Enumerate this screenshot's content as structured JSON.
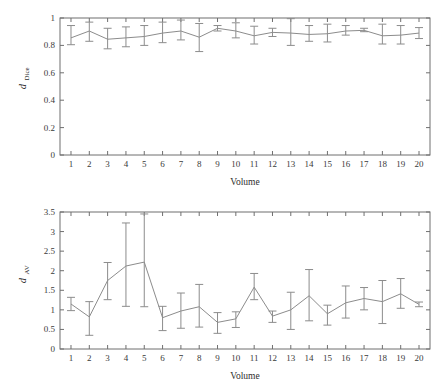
{
  "figure": {
    "background": "#ffffff",
    "line_color": "#8c8c8c",
    "axis_color": "#6f6f6f",
    "text_color": "#2e2e2e"
  },
  "chart_data": [
    {
      "type": "line",
      "panel": "top",
      "title": "",
      "xlabel": "Volume",
      "ylabel": "d_Dice",
      "ylabel_base": "d",
      "ylabel_sub": "Dice",
      "xlim": [
        0.4,
        20.6
      ],
      "ylim": [
        0,
        1
      ],
      "grid": false,
      "legend": null,
      "error_bars": true,
      "xtick_labels": [
        "1",
        "2",
        "3",
        "4",
        "5",
        "6",
        "7",
        "8",
        "9",
        "10",
        "11",
        "12",
        "13",
        "14",
        "15",
        "16",
        "17",
        "18",
        "19",
        "20"
      ],
      "ytick_labels": [
        "0",
        "0.2",
        "0.4",
        "0.6",
        "0.8",
        "1"
      ],
      "yticks": [
        0,
        0.2,
        0.4,
        0.6,
        0.8,
        1
      ],
      "x": [
        1,
        2,
        3,
        4,
        5,
        6,
        7,
        8,
        9,
        10,
        11,
        12,
        13,
        14,
        15,
        16,
        17,
        18,
        19,
        20
      ],
      "values": [
        0.855,
        0.905,
        0.845,
        0.855,
        0.865,
        0.89,
        0.905,
        0.86,
        0.925,
        0.905,
        0.87,
        0.895,
        0.89,
        0.88,
        0.885,
        0.905,
        0.91,
        0.87,
        0.875,
        0.89
      ],
      "err_low": [
        0.805,
        0.83,
        0.775,
        0.79,
        0.8,
        0.82,
        0.84,
        0.755,
        0.905,
        0.855,
        0.81,
        0.865,
        0.8,
        0.83,
        0.825,
        0.875,
        0.9,
        0.81,
        0.81,
        0.85
      ],
      "err_high": [
        0.945,
        0.97,
        0.925,
        0.935,
        0.945,
        0.97,
        0.985,
        0.96,
        0.945,
        0.965,
        0.94,
        0.925,
        0.995,
        0.945,
        0.955,
        0.945,
        0.925,
        0.955,
        0.945,
        0.93
      ]
    },
    {
      "type": "line",
      "panel": "bottom",
      "title": "",
      "xlabel": "Volume",
      "ylabel": "d_AV",
      "ylabel_base": "d",
      "ylabel_sub": "AV",
      "xlim": [
        0.4,
        20.6
      ],
      "ylim": [
        0,
        3.5
      ],
      "grid": false,
      "legend": null,
      "error_bars": true,
      "xtick_labels": [
        "1",
        "2",
        "3",
        "4",
        "5",
        "6",
        "7",
        "8",
        "9",
        "10",
        "11",
        "12",
        "13",
        "14",
        "15",
        "16",
        "17",
        "18",
        "19",
        "20"
      ],
      "ytick_labels": [
        "0",
        "0.5",
        "1",
        "1.5",
        "2",
        "2.5",
        "3",
        "3.5"
      ],
      "yticks": [
        0,
        0.5,
        1,
        1.5,
        2,
        2.5,
        3,
        3.5
      ],
      "x": [
        1,
        2,
        3,
        4,
        5,
        6,
        7,
        8,
        9,
        10,
        11,
        12,
        13,
        14,
        15,
        16,
        17,
        18,
        19,
        20
      ],
      "values": [
        1.15,
        0.82,
        1.75,
        2.12,
        2.22,
        0.8,
        0.97,
        1.08,
        0.68,
        0.77,
        1.58,
        0.84,
        1.0,
        1.36,
        0.9,
        1.18,
        1.29,
        1.21,
        1.41,
        1.14
      ],
      "err_low": [
        0.98,
        0.35,
        1.26,
        1.09,
        1.08,
        0.47,
        0.53,
        0.56,
        0.4,
        0.55,
        1.26,
        0.68,
        0.5,
        0.72,
        0.61,
        0.79,
        1.0,
        0.65,
        1.04,
        1.08
      ],
      "err_high": [
        1.32,
        1.21,
        2.21,
        3.22,
        3.45,
        1.09,
        1.43,
        1.65,
        0.93,
        0.95,
        1.93,
        0.97,
        1.45,
        2.03,
        1.12,
        1.61,
        1.57,
        1.75,
        1.8,
        1.2
      ]
    }
  ]
}
